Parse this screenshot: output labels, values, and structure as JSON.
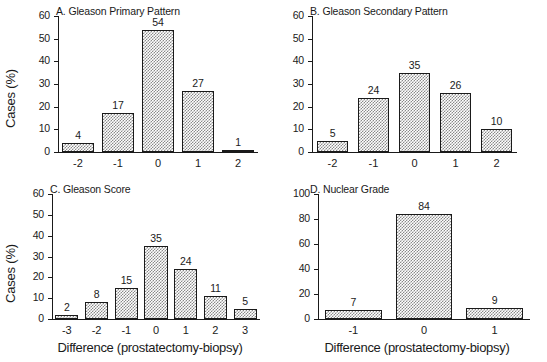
{
  "figure": {
    "background": "#ffffff",
    "bar_fill": "#8a8a8a",
    "line_color": "#1a1a1a"
  },
  "axis_titles": {
    "y": "Cases (%)",
    "x": "Difference (prostatectomy-biopsy)"
  },
  "panels": {
    "a": {
      "title": "A. Gleason Primary Pattern",
      "ylabel": "Cases (%)",
      "xlabel": "",
      "yticks": [
        "0",
        "10",
        "20",
        "30",
        "40",
        "50",
        "60"
      ],
      "xticks": [
        "-2",
        "-1",
        "0",
        "1",
        "2"
      ],
      "values": [
        "4",
        "17",
        "54",
        "27",
        "1"
      ]
    },
    "b": {
      "title": "B. Gleason Secondary Pattern",
      "ylabel": "",
      "xlabel": "",
      "yticks": [
        "0",
        "10",
        "20",
        "30",
        "40",
        "50",
        "60"
      ],
      "xticks": [
        "-2",
        "-1",
        "0",
        "1",
        "2"
      ],
      "values": [
        "5",
        "24",
        "35",
        "26",
        "10"
      ]
    },
    "c": {
      "title": "C. Gleason Score",
      "ylabel": "Cases (%)",
      "xlabel": "Difference (prostatectomy-biopsy)",
      "yticks": [
        "0",
        "10",
        "20",
        "30",
        "40",
        "50",
        "60"
      ],
      "xticks": [
        "-3",
        "-2",
        "-1",
        "0",
        "1",
        "2",
        "3"
      ],
      "values": [
        "2",
        "8",
        "15",
        "35",
        "24",
        "11",
        "5"
      ]
    },
    "d": {
      "title": "D. Nuclear Grade",
      "ylabel": "",
      "xlabel": "Difference (prostatectomy-biopsy)",
      "yticks": [
        "0",
        "20",
        "40",
        "60",
        "80",
        "100"
      ],
      "xticks": [
        "-1",
        "0",
        "1"
      ],
      "values": [
        "7",
        "84",
        "9"
      ]
    }
  },
  "chart_data": [
    {
      "panel": "A",
      "type": "bar",
      "title": "A. Gleason Primary Pattern",
      "xlabel": "Difference (prostatectomy-biopsy)",
      "ylabel": "Cases (%)",
      "categories": [
        "-2",
        "-1",
        "0",
        "1",
        "2"
      ],
      "values": [
        4,
        17,
        54,
        27,
        1
      ],
      "ylim": [
        0,
        60
      ],
      "ytick_step": 10,
      "grid": false,
      "legend": null
    },
    {
      "panel": "B",
      "type": "bar",
      "title": "B. Gleason Secondary Pattern",
      "xlabel": "Difference (prostatectomy-biopsy)",
      "ylabel": "Cases (%)",
      "categories": [
        "-2",
        "-1",
        "0",
        "1",
        "2"
      ],
      "values": [
        5,
        24,
        35,
        26,
        10
      ],
      "ylim": [
        0,
        60
      ],
      "ytick_step": 10,
      "grid": false,
      "legend": null
    },
    {
      "panel": "C",
      "type": "bar",
      "title": "C. Gleason Score",
      "xlabel": "Difference (prostatectomy-biopsy)",
      "ylabel": "Cases (%)",
      "categories": [
        "-3",
        "-2",
        "-1",
        "0",
        "1",
        "2",
        "3"
      ],
      "values": [
        2,
        8,
        15,
        35,
        24,
        11,
        5
      ],
      "ylim": [
        0,
        60
      ],
      "ytick_step": 10,
      "grid": false,
      "legend": null
    },
    {
      "panel": "D",
      "type": "bar",
      "title": "D. Nuclear Grade",
      "xlabel": "Difference (prostatectomy-biopsy)",
      "ylabel": "Cases (%)",
      "categories": [
        "-1",
        "0",
        "1"
      ],
      "values": [
        7,
        84,
        9
      ],
      "ylim": [
        0,
        100
      ],
      "ytick_step": 20,
      "grid": false,
      "legend": null
    }
  ]
}
